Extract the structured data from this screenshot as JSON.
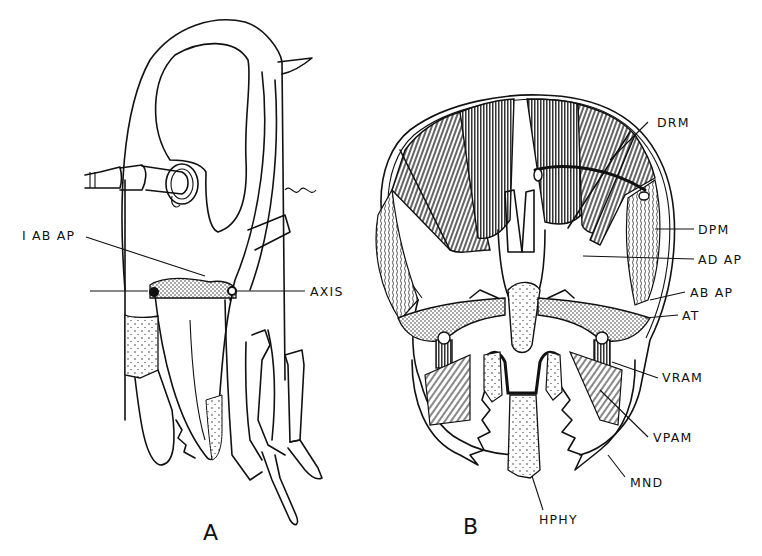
{
  "figure": {
    "panels": [
      {
        "id": "A",
        "label": "A",
        "annotations": [
          {
            "id": "iabap",
            "text": "I AB AP"
          },
          {
            "id": "axis",
            "text": "AXIS"
          }
        ]
      },
      {
        "id": "B",
        "label": "B",
        "annotations": [
          {
            "id": "drm",
            "text": "DRM"
          },
          {
            "id": "dpm",
            "text": "DPM"
          },
          {
            "id": "adap",
            "text": "AD AP"
          },
          {
            "id": "abap",
            "text": "AB AP"
          },
          {
            "id": "at",
            "text": "AT"
          },
          {
            "id": "vram",
            "text": "VRAM"
          },
          {
            "id": "vpam",
            "text": "VPAM"
          },
          {
            "id": "mnd",
            "text": "MND"
          },
          {
            "id": "hphy",
            "text": "HPHY"
          }
        ]
      }
    ],
    "colors": {
      "ink": "#111111",
      "paper": "#ffffff"
    }
  }
}
